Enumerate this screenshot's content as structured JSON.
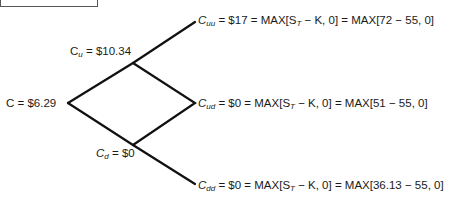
{
  "title_box": {
    "text": ""
  },
  "nodes": {
    "root": {
      "var": "C",
      "sub": "",
      "value": "$6.29"
    },
    "up": {
      "var": "C",
      "sub": "u",
      "value": "$10.34"
    },
    "down": {
      "var": "C",
      "sub": "d",
      "value": "$0"
    },
    "uu": {
      "var": "C",
      "sub": "uu",
      "value": "$17",
      "formula": "MAX[S",
      "formula_sub": "T",
      "formula_rest": " − K, 0]",
      "calc": "MAX[72 − 55, 0]"
    },
    "ud": {
      "var": "C",
      "sub": "ud",
      "value": "$0",
      "formula": "MAX[S",
      "formula_sub": "T",
      "formula_rest": " − K, 0]",
      "calc": "MAX[51 − 55, 0]"
    },
    "dd": {
      "var": "C",
      "sub": "dd",
      "value": "$0",
      "formula": "MAX[S",
      "formula_sub": "T",
      "formula_rest": " − K, 0]",
      "calc": "MAX[36.13 − 55, 0]"
    }
  },
  "equals": "=",
  "line_color": "#111111"
}
